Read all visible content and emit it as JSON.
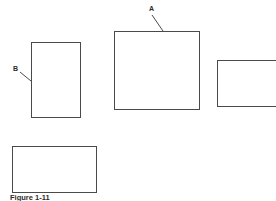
{
  "figure": {
    "background_color": "#ffffff",
    "line_color": "#4a4a4a",
    "text_color": "#2b2b2b",
    "caption": "Figure 1-11",
    "shapes": [
      {
        "id": "rect-b",
        "name": "rectangle-b",
        "label_ref": "B",
        "x": 31,
        "y": 42,
        "width": 50,
        "height": 76,
        "clipped": false
      },
      {
        "id": "rect-a",
        "name": "rectangle-a",
        "label_ref": "A",
        "x": 114,
        "y": 31,
        "width": 86,
        "height": 79,
        "clipped": false
      },
      {
        "id": "rect-right",
        "name": "rectangle-right-clipped",
        "label_ref": "",
        "x": 217,
        "y": 60,
        "width": 70,
        "height": 47,
        "clipped": true
      },
      {
        "id": "rect-bottom",
        "name": "rectangle-bottom",
        "label_ref": "",
        "x": 12,
        "y": 146,
        "width": 85,
        "height": 47,
        "clipped": false
      }
    ],
    "callouts": [
      {
        "id": "callout-a",
        "text": "A",
        "x": 149,
        "y": 5,
        "leader": {
          "x1": 152,
          "y1": 15,
          "x2": 163,
          "y2": 31
        }
      },
      {
        "id": "callout-b",
        "text": "B",
        "x": 13,
        "y": 65,
        "leader": {
          "x1": 20,
          "y1": 72,
          "x2": 31,
          "y2": 81
        }
      }
    ]
  }
}
